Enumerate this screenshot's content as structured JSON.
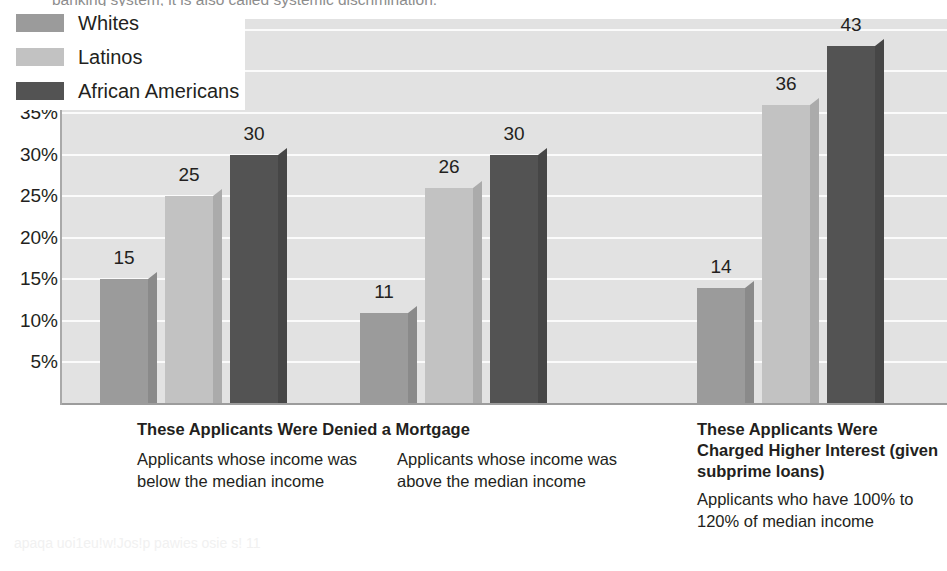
{
  "bleed": {
    "top_text": "banking system, it is also called systemic discrimination.",
    "bottom_text": "apaqa uoi1eu!w!Jos!p pawies osie s! 11"
  },
  "legend": {
    "items": [
      {
        "label": "Whites",
        "color": "#9b9b9b",
        "swatch": "legend-swatch-whites"
      },
      {
        "label": "Latinos",
        "color": "#c2c2c2",
        "swatch": "legend-swatch-latinos"
      },
      {
        "label": "African Americans",
        "color": "#535353",
        "swatch": "legend-swatch-african-americans"
      }
    ]
  },
  "captions": {
    "group1_heading": "These Applicants Were Denied a Mortgage",
    "group1_body": "Applicants whose income was below the median income",
    "group2_body": "Applicants whose income was above the median income",
    "group3_heading": "These Applicants Were Charged Higher Interest (given subprime loans)",
    "group3_body": "Applicants who have 100% to 120% of median income"
  },
  "chart_data": {
    "type": "bar",
    "title": "",
    "xlabel": "",
    "ylabel": "",
    "ylim": [
      0,
      45
    ],
    "grid": true,
    "legend_position": "top-left",
    "ytick_labels": [
      "45%",
      "40%",
      "35%",
      "30%",
      "25%",
      "20%",
      "15%",
      "10%",
      "5%"
    ],
    "ytick_values": [
      45,
      40,
      35,
      30,
      25,
      20,
      15,
      10,
      5
    ],
    "categories": [
      "Applicants whose income was below the median income",
      "Applicants whose income was above the median income",
      "Applicants who have 100% to 120% of median income"
    ],
    "series": [
      {
        "name": "Whites",
        "color": "#9b9b9b",
        "values": [
          15,
          11,
          14
        ]
      },
      {
        "name": "Latinos",
        "color": "#c2c2c2",
        "values": [
          25,
          26,
          36
        ]
      },
      {
        "name": "African Americans",
        "color": "#535353",
        "values": [
          30,
          30,
          43
        ]
      }
    ],
    "value_labels": [
      [
        "15",
        "25",
        "30"
      ],
      [
        "11",
        "26",
        "30"
      ],
      [
        "14",
        "36",
        "43"
      ]
    ]
  }
}
